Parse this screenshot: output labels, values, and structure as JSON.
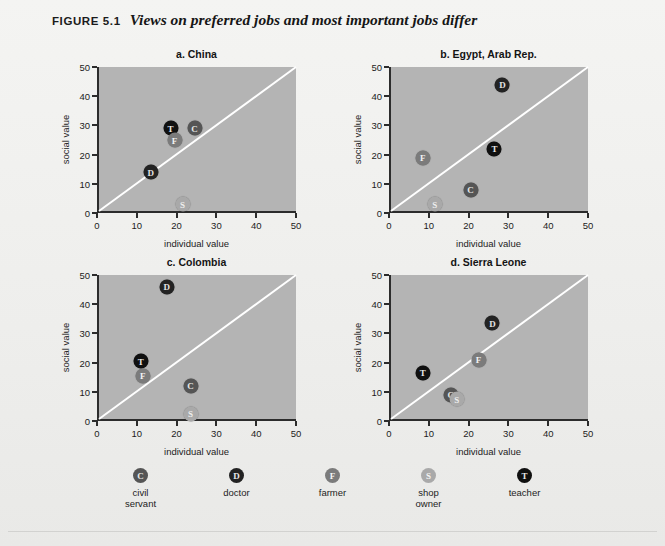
{
  "figure": {
    "number_label": "FIGURE 5.1",
    "title": "Views on preferred jobs and most important jobs differ",
    "background_color": "#f2f2f0",
    "plot_fill_color": "#b4b4b4",
    "diagonal_line_color": "#ffffff"
  },
  "axes": {
    "xlabel": "individual value",
    "ylabel": "social value",
    "ticks": [
      "0",
      "10",
      "20",
      "30",
      "40",
      "50"
    ],
    "xlim": [
      0,
      50
    ],
    "ylim": [
      0,
      50
    ]
  },
  "legend": {
    "items": [
      {
        "code": "C",
        "label": "civil servant",
        "label_line1": "civil",
        "label_line2": "servant",
        "color": "#555555"
      },
      {
        "code": "D",
        "label": "doctor",
        "label_line1": "doctor",
        "label_line2": "",
        "color": "#232323"
      },
      {
        "code": "F",
        "label": "farmer",
        "label_line1": "farmer",
        "label_line2": "",
        "color": "#7b7b7b"
      },
      {
        "code": "S",
        "label": "shop owner",
        "label_line1": "shop",
        "label_line2": "owner",
        "color": "#a9a9a9"
      },
      {
        "code": "T",
        "label": "teacher",
        "label_line1": "teacher",
        "label_line2": "",
        "color": "#101010"
      }
    ]
  },
  "source_note": "",
  "chart_data": [
    {
      "type": "scatter",
      "title": "a. China",
      "panel": "a",
      "xlabel": "individual value",
      "ylabel": "social value",
      "xlim": [
        0,
        50
      ],
      "ylim": [
        0,
        50
      ],
      "xticks": [
        0,
        10,
        20,
        30,
        40,
        50
      ],
      "yticks": [
        0,
        10,
        20,
        30,
        40,
        50
      ],
      "grid": false,
      "reference_line": "y = x (45-degree diagonal)",
      "points": [
        {
          "code": "T",
          "label": "teacher",
          "x": 18,
          "y": 29
        },
        {
          "code": "C",
          "label": "civil servant",
          "x": 24,
          "y": 29
        },
        {
          "code": "F",
          "label": "farmer",
          "x": 19,
          "y": 25
        },
        {
          "code": "D",
          "label": "doctor",
          "x": 13,
          "y": 14
        },
        {
          "code": "S",
          "label": "shop owner",
          "x": 21,
          "y": 3
        }
      ]
    },
    {
      "type": "scatter",
      "title": "b.  Egypt, Arab Rep.",
      "panel": "b",
      "xlabel": "individual value",
      "ylabel": "social value",
      "xlim": [
        0,
        50
      ],
      "ylim": [
        0,
        50
      ],
      "xticks": [
        0,
        10,
        20,
        30,
        40,
        50
      ],
      "yticks": [
        0,
        10,
        20,
        30,
        40,
        50
      ],
      "grid": false,
      "reference_line": "y = x (45-degree diagonal)",
      "points": [
        {
          "code": "D",
          "label": "doctor",
          "x": 28,
          "y": 44
        },
        {
          "code": "T",
          "label": "teacher",
          "x": 26,
          "y": 22
        },
        {
          "code": "F",
          "label": "farmer",
          "x": 8,
          "y": 19
        },
        {
          "code": "C",
          "label": "civil servant",
          "x": 20,
          "y": 8
        },
        {
          "code": "S",
          "label": "shop owner",
          "x": 11,
          "y": 3
        }
      ]
    },
    {
      "type": "scatter",
      "title": "c.  Colombia",
      "panel": "c",
      "xlabel": "individual value",
      "ylabel": "social value",
      "xlim": [
        0,
        50
      ],
      "ylim": [
        0,
        50
      ],
      "xticks": [
        0,
        10,
        20,
        30,
        40,
        50
      ],
      "yticks": [
        0,
        10,
        20,
        30,
        40,
        50
      ],
      "grid": false,
      "reference_line": "y = x (45-degree diagonal)",
      "points": [
        {
          "code": "D",
          "label": "doctor",
          "x": 17,
          "y": 46
        },
        {
          "code": "T",
          "label": "teacher",
          "x": 10.5,
          "y": 20.5
        },
        {
          "code": "F",
          "label": "farmer",
          "x": 11,
          "y": 15.5
        },
        {
          "code": "C",
          "label": "civil servant",
          "x": 23,
          "y": 12
        },
        {
          "code": "S",
          "label": "shop owner",
          "x": 23,
          "y": 2.5
        }
      ]
    },
    {
      "type": "scatter",
      "title": "d.  Sierra Leone",
      "panel": "d",
      "xlabel": "individual value",
      "ylabel": "social value",
      "xlim": [
        0,
        50
      ],
      "ylim": [
        0,
        50
      ],
      "xticks": [
        0,
        10,
        20,
        30,
        40,
        50
      ],
      "yticks": [
        0,
        10,
        20,
        30,
        40,
        50
      ],
      "grid": false,
      "reference_line": "y = x (45-degree diagonal)",
      "points": [
        {
          "code": "D",
          "label": "doctor",
          "x": 25.5,
          "y": 33.5
        },
        {
          "code": "F",
          "label": "farmer",
          "x": 22,
          "y": 21
        },
        {
          "code": "T",
          "label": "teacher",
          "x": 8,
          "y": 16.5
        },
        {
          "code": "C",
          "label": "civil servant",
          "x": 15,
          "y": 9
        },
        {
          "code": "S",
          "label": "shop owner",
          "x": 16.5,
          "y": 7.5
        }
      ]
    }
  ]
}
